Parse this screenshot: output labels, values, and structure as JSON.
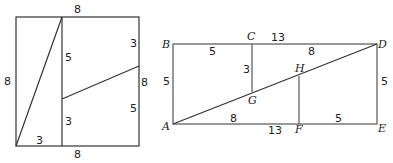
{
  "left_figure": {
    "description": "8x8 square dissected into pieces",
    "labels": {
      "top": "8",
      "left": "8",
      "right": "8",
      "bottom": "8",
      "bottom_left_segment": "3",
      "inner_vertical_upper": "5",
      "inner_vertical_lower": "3",
      "right_upper": "3",
      "right_lower": "5"
    }
  },
  "right_figure": {
    "description": "5x13 rectangle rearrangement",
    "points": {
      "A": "A",
      "B": "B",
      "C": "C",
      "D": "D",
      "E": "E",
      "F": "F",
      "G": "G",
      "H": "H"
    },
    "labels": {
      "BC": "5",
      "CD_total": "13",
      "CD_segment": "8",
      "AB": "5",
      "CG": "3",
      "DE": "5",
      "AF_segment": "8",
      "AE_total": "13",
      "FE": "5"
    }
  }
}
